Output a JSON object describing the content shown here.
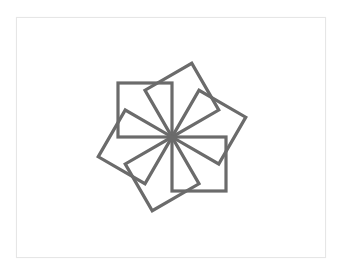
{
  "figure": {
    "shape": "square",
    "count": 6,
    "rotation_step_deg": 60,
    "stroke_color": "#6b6b6b",
    "fill_color": "none",
    "background_color": "#ffffff",
    "border_color": "#e6e6e6"
  }
}
